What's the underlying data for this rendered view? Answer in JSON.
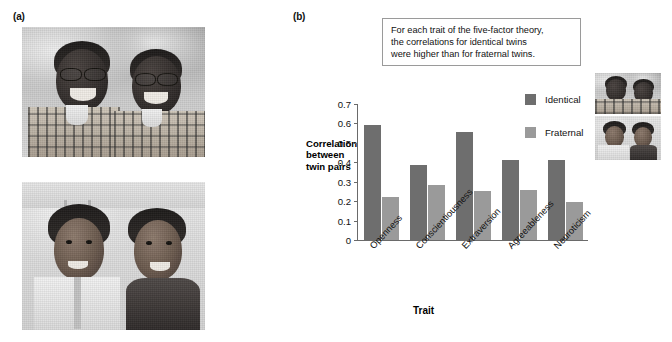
{
  "figure": {
    "panel_a_label": "(a)",
    "panel_b_label": "(b)"
  },
  "photos": {
    "top": {
      "alt_name": "identical-twin-brothers-photo"
    },
    "bottom": {
      "alt_name": "fraternal-twins-brother-sister-photo"
    }
  },
  "callout": {
    "line1": "For each trait of the five-factor theory,",
    "line2": "the correlations for identical twins",
    "line3": "were higher than for fraternal twins."
  },
  "legend": {
    "identical_label": "Identical",
    "fraternal_label": "Fraternal",
    "identical_color": "#6e6e6e",
    "fraternal_color": "#9a9a9a"
  },
  "chart_data": {
    "type": "bar",
    "title": "",
    "xlabel": "Trait",
    "ylabel": "Correlation between twin pairs",
    "ylabel_lines": [
      "Correlation",
      "between",
      "twin pairs"
    ],
    "categories": [
      "Openness",
      "Conscientiousness",
      "Extraversion",
      "Agreeableness",
      "Neuroticism"
    ],
    "series": [
      {
        "name": "Identical",
        "color": "#6e6e6e",
        "values": [
          0.59,
          0.385,
          0.555,
          0.41,
          0.41
        ]
      },
      {
        "name": "Fraternal",
        "color": "#9a9a9a",
        "values": [
          0.22,
          0.285,
          0.25,
          0.26,
          0.195
        ]
      }
    ],
    "ylim": [
      0,
      0.7
    ],
    "yticks": [
      0,
      0.1,
      0.2,
      0.3,
      0.4,
      0.5,
      0.6,
      0.7
    ],
    "ytick_labels": [
      "0",
      "0.1",
      "0.2",
      "0.3",
      "0.4",
      "0.5",
      "0.6",
      "0.7"
    ],
    "grid": false,
    "legend_position": "upper-right-inside"
  }
}
